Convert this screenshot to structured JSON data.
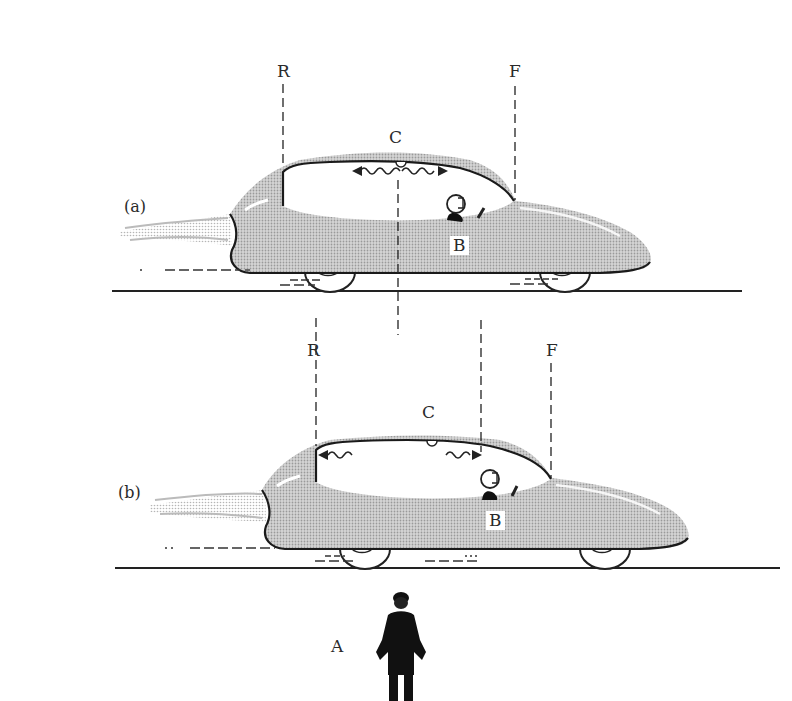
{
  "figure": {
    "panels": [
      {
        "id": "a",
        "panel_label": "(a)",
        "markers": {
          "rear": "R",
          "front": "F",
          "center": "C",
          "car": "B"
        }
      },
      {
        "id": "b",
        "panel_label": "(b)",
        "markers": {
          "rear": "R",
          "front": "F",
          "center": "C",
          "car": "B"
        }
      }
    ],
    "observer_label": "A",
    "colors": {
      "body_fill": "#c8c8c8",
      "outline": "#1a1a1a",
      "background": "#ffffff",
      "ground": "#222222"
    }
  }
}
